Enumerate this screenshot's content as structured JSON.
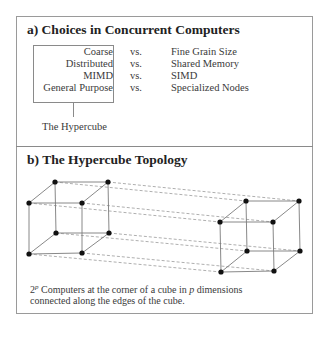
{
  "section_a": {
    "title": "a) Choices in Concurrent Computers",
    "rows": [
      {
        "left": "Coarse",
        "vs": "vs.",
        "right": "Fine Grain Size"
      },
      {
        "left": "Distributed",
        "vs": "vs.",
        "right": "Shared Memory"
      },
      {
        "left": "MIMD",
        "vs": "vs.",
        "right": "SIMD"
      },
      {
        "left": "General Purpose",
        "vs": "vs.",
        "right": "Specialized Nodes"
      }
    ],
    "box_label": "The Hypercube"
  },
  "section_b": {
    "title": "b) The Hypercube Topology",
    "caption_line1_prefix": "2",
    "caption_superscript": "p",
    "caption_line1_rest": " Computers at the corner of a cube in ",
    "caption_italic": "p",
    "caption_line1_end": " dimensions",
    "caption_line2": "connected along the edges of the cube."
  },
  "diagram": {
    "node_color": "#111111",
    "edge_color": "#8a8a8a",
    "dashed_color": "#9a9a9a",
    "left_cube": [
      [
        55,
        182
      ],
      [
        108,
        182
      ],
      [
        29,
        203
      ],
      [
        82,
        203
      ],
      [
        56,
        233
      ],
      [
        109,
        233
      ],
      [
        29,
        254
      ],
      [
        82,
        253
      ]
    ],
    "right_cube": [
      [
        246,
        201
      ],
      [
        299,
        201
      ],
      [
        220,
        222
      ],
      [
        273,
        222
      ],
      [
        247,
        251
      ],
      [
        300,
        251
      ],
      [
        221,
        272
      ],
      [
        274,
        271
      ]
    ]
  }
}
